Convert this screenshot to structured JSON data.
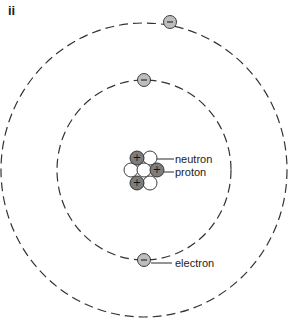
{
  "panel_label": "ii",
  "diagram": {
    "colors": {
      "orbit": "#333333",
      "proton_fill": "#7d7d7d",
      "neutron_fill": "#ffffff",
      "electron_fill": "#bdbdbd",
      "stroke": "#2a2a2a"
    },
    "orbits": [
      {
        "name": "inner-shell",
        "cx": 144,
        "cy": 170,
        "rx": 87,
        "ry": 90
      },
      {
        "name": "outer-shell",
        "cx": 144,
        "cy": 170,
        "rx": 143,
        "ry": 147
      }
    ],
    "nucleus": [
      {
        "type": "proton",
        "x": 137,
        "y": 158,
        "sign": "+"
      },
      {
        "type": "neutron",
        "x": 150,
        "y": 158,
        "sign": ""
      },
      {
        "type": "neutron",
        "x": 131,
        "y": 170,
        "sign": ""
      },
      {
        "type": "neutron",
        "x": 144,
        "y": 170,
        "sign": ""
      },
      {
        "type": "proton",
        "x": 157,
        "y": 170,
        "sign": "+"
      },
      {
        "type": "proton",
        "x": 137,
        "y": 183,
        "sign": "+"
      },
      {
        "type": "neutron",
        "x": 150,
        "y": 183,
        "sign": ""
      }
    ],
    "electrons": [
      {
        "shell": "outer",
        "x": 170,
        "y": 22,
        "sign": "−"
      },
      {
        "shell": "inner",
        "x": 144,
        "y": 80,
        "sign": "−"
      },
      {
        "shell": "inner",
        "x": 144,
        "y": 260,
        "sign": "−"
      }
    ],
    "labels": {
      "neutron": "neutron",
      "proton": "proton",
      "electron": "electron"
    }
  }
}
